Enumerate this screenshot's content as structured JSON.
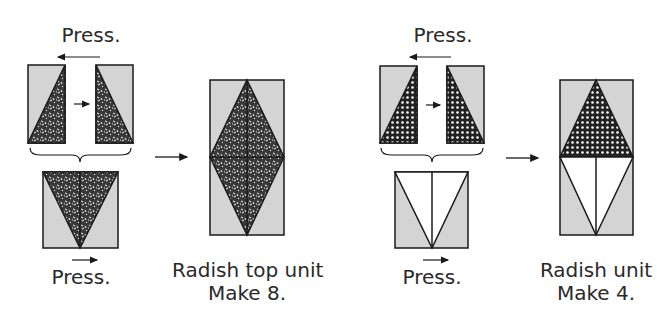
{
  "colors": {
    "background_fabric": "#d4d4d4",
    "print_fabric": "#3a3a3a",
    "print_speckle": "#ffffff",
    "light_fabric": "#ffffff",
    "outline": "#1a1a1a"
  },
  "left_panel": {
    "top_press_label": "Press.",
    "bottom_press_label": "Press.",
    "result_caption_line1": "Radish top unit",
    "result_caption_line2": "Make 8.",
    "fabric_pattern": "speckled-print"
  },
  "right_panel": {
    "top_press_label": "Press.",
    "bottom_press_label": "Press.",
    "result_caption_line1": "Radish unit",
    "result_caption_line2": "Make 4.",
    "fabric_pattern": "dotted-print"
  },
  "icons": {
    "press_arrow": "arrow-left-icon",
    "join_arrow": "arrow-right-icon",
    "step_arrow": "arrow-right-icon",
    "brace": "curly-brace"
  }
}
